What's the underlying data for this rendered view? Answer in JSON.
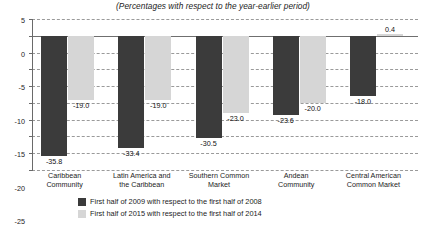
{
  "chart_data": {
    "type": "bar",
    "title": "(Percentages with respect to the year-earlier period)",
    "xlabel": "",
    "ylabel": "",
    "ylim": [
      -40,
      5
    ],
    "ytick_step": 5,
    "yticks": [
      "5",
      "0",
      "-5",
      "-10",
      "-15",
      "-20",
      "-25",
      "-30",
      "-35",
      "-40"
    ],
    "grid": true,
    "legend_position": "bottom",
    "categories": [
      "Caribbean\nCommunity",
      "Latin America and\nthe Caribbean",
      "Southern Common\nMarket",
      "Andean\nCommunity",
      "Central American\nCommon Market"
    ],
    "category_lines": [
      [
        "Caribbean",
        "Community"
      ],
      [
        "Latin America and",
        "the Caribbean"
      ],
      [
        "Southern Common",
        "Market"
      ],
      [
        "Andean",
        "Community"
      ],
      [
        "Central American",
        "Common Market"
      ]
    ],
    "series": [
      {
        "name": "First half of 2009 with respect to the first half of 2008",
        "color": "#3b3b3b",
        "values": [
          -35.8,
          -33.4,
          -30.5,
          -23.6,
          -18.0
        ],
        "labels": [
          "-35.8",
          "-33.4",
          "-30.5",
          "-23.6",
          "-18.0"
        ]
      },
      {
        "name": "First half of 2015 with respect to the first half of 2014",
        "color": "#d6d6d6",
        "values": [
          -19.0,
          -19.0,
          -23.0,
          -20.0,
          0.4
        ],
        "labels": [
          "-19.0",
          "-19.0",
          "-23.0",
          "-20.0",
          "0.4"
        ]
      }
    ]
  },
  "legend": {
    "items": [
      {
        "label": "First half of 2009 with respect to the first half of 2008",
        "swatch": "dark"
      },
      {
        "label": "First half of 2015 with respect to the first half of 2014",
        "swatch": "light"
      }
    ]
  }
}
